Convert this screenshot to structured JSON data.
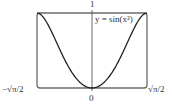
{
  "chart_data": {
    "type": "line",
    "title": "",
    "function_label": "y = sin(x²)",
    "xlabel": "",
    "ylabel": "",
    "x_ticks": [
      "−√π/2",
      "0",
      "√π/2"
    ],
    "y_ticks": [
      "1"
    ],
    "xlim": [
      -1.2533,
      1.2533
    ],
    "ylim": [
      0,
      1
    ],
    "grid": false,
    "legend": "none",
    "series": [
      {
        "name": "y = sin(x²)",
        "x": [
          -1.2533,
          -1.1,
          -1.0,
          -0.9,
          -0.8,
          -0.7,
          -0.6,
          -0.5,
          -0.4,
          -0.3,
          -0.2,
          -0.1,
          0,
          0.1,
          0.2,
          0.3,
          0.4,
          0.5,
          0.6,
          0.7,
          0.8,
          0.9,
          1.0,
          1.1,
          1.2533
        ],
        "values": [
          1.0,
          0.935,
          0.841,
          0.718,
          0.595,
          0.471,
          0.353,
          0.247,
          0.159,
          0.09,
          0.04,
          0.01,
          0,
          0.01,
          0.04,
          0.09,
          0.159,
          0.247,
          0.353,
          0.471,
          0.595,
          0.718,
          0.841,
          0.935,
          1.0
        ]
      }
    ]
  },
  "labels": {
    "y_top": "1",
    "x_zero": "0",
    "x_left": "−√π/2",
    "x_right": "√π/2",
    "equation": "y = sin(x²)"
  },
  "colors": {
    "frame": "#6b6b6b",
    "curve": "#222222",
    "axis": "#444444"
  }
}
